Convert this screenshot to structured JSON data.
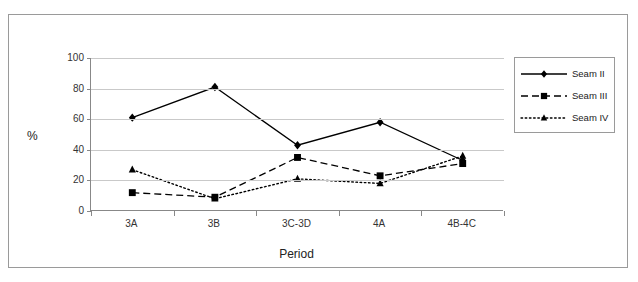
{
  "chart_data": {
    "type": "line",
    "title": "",
    "xlabel": "Period",
    "ylabel": "%",
    "categories": [
      "3A",
      "3B",
      "3C-3D",
      "4A",
      "4B-4C"
    ],
    "ylim": [
      0,
      100
    ],
    "ytick_labels": [
      "0",
      "20",
      "40",
      "60",
      "80",
      "100"
    ],
    "yticks": [
      0,
      20,
      40,
      60,
      80,
      100
    ],
    "grid": true,
    "legend_position": "right",
    "series": [
      {
        "name": "Seam II",
        "marker": "diamond",
        "line_style": "solid",
        "color": "#000000",
        "values": [
          61,
          81,
          43,
          58,
          33
        ]
      },
      {
        "name": "Seam III",
        "marker": "square",
        "line_style": "dashed",
        "color": "#000000",
        "values": [
          12,
          9,
          35,
          23,
          31
        ]
      },
      {
        "name": "Seam IV",
        "marker": "triangle",
        "line_style": "dotted",
        "color": "#000000",
        "values": [
          27,
          8,
          21,
          18,
          36
        ]
      }
    ]
  },
  "legend": {
    "items": [
      {
        "label": "Seam II"
      },
      {
        "label": "Seam III"
      },
      {
        "label": "Seam IV"
      }
    ]
  },
  "axes": {
    "x_title": "Period",
    "y_title": "%"
  }
}
